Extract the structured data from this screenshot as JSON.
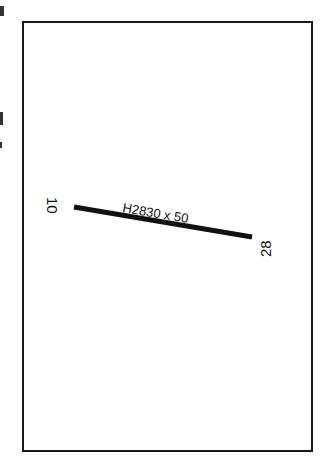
{
  "diagram": {
    "type": "airport-runway-sketch",
    "runway": {
      "label": "H2830 x 50",
      "surface_prefix": "H",
      "length_ft": 2830,
      "width_ft": 50,
      "end_west": "10",
      "end_east": "28"
    },
    "colors": {
      "frame": "#1a1a1a",
      "runway": "#111111",
      "background": "#ffffff"
    }
  }
}
